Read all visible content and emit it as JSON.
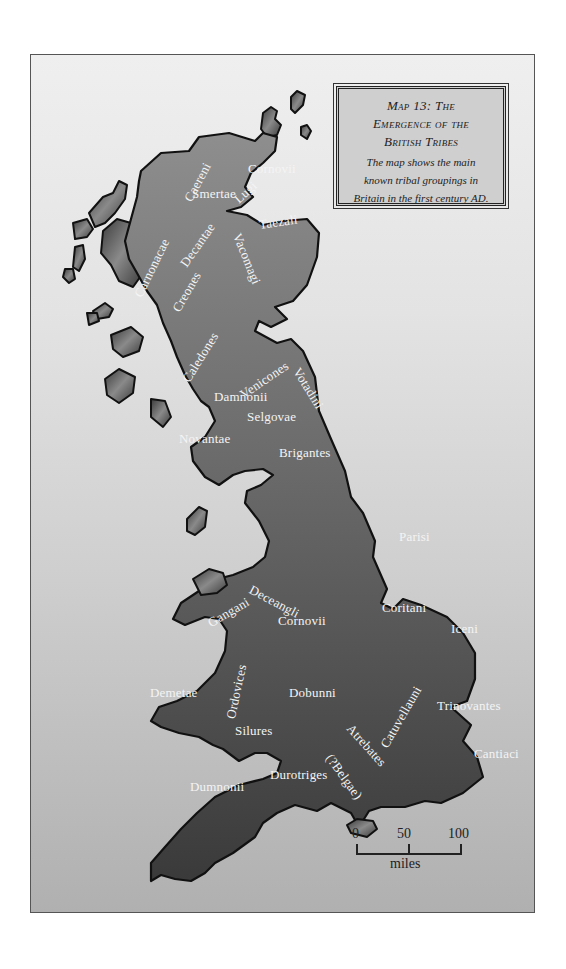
{
  "legend": {
    "title_line1": "Map 13: The",
    "title_line2": "Emergence of the",
    "title_line3": "British Tribes",
    "desc_line1": "The map shows the main",
    "desc_line2": "known tribal groupings in",
    "desc_line3": "Britain in the first century AD."
  },
  "tribes": [
    {
      "name": "Cornovii",
      "region": "north-scotland"
    },
    {
      "name": "Caereni",
      "region": "north-scotland"
    },
    {
      "name": "Smertae",
      "region": "north-scotland"
    },
    {
      "name": "Lugi",
      "region": "north-scotland"
    },
    {
      "name": "Carnonacae",
      "region": "north-scotland"
    },
    {
      "name": "Decantae",
      "region": "north-scotland"
    },
    {
      "name": "Taezali",
      "region": "scotland"
    },
    {
      "name": "Creones",
      "region": "scotland"
    },
    {
      "name": "Vacomagi",
      "region": "scotland"
    },
    {
      "name": "Caledones",
      "region": "scotland"
    },
    {
      "name": "Venicones",
      "region": "scotland"
    },
    {
      "name": "Damnonii",
      "region": "scotland"
    },
    {
      "name": "Votadini",
      "region": "scotland"
    },
    {
      "name": "Selgovae",
      "region": "scotland"
    },
    {
      "name": "Novantae",
      "region": "scotland"
    },
    {
      "name": "Brigantes",
      "region": "england"
    },
    {
      "name": "Parisi",
      "region": "england"
    },
    {
      "name": "Gangani",
      "region": "wales"
    },
    {
      "name": "Deceangli",
      "region": "wales"
    },
    {
      "name": "Coritani",
      "region": "england"
    },
    {
      "name": "Iceni",
      "region": "england"
    },
    {
      "name": "Ordovices",
      "region": "wales"
    },
    {
      "name": "Cornovii",
      "region": "england"
    },
    {
      "name": "Demetae",
      "region": "wales"
    },
    {
      "name": "Dobunni",
      "region": "england"
    },
    {
      "name": "Catuvellauni",
      "region": "england"
    },
    {
      "name": "Trinovantes",
      "region": "england"
    },
    {
      "name": "Silures",
      "region": "wales"
    },
    {
      "name": "Atrebates",
      "region": "england"
    },
    {
      "name": "(?Belgae)",
      "region": "england"
    },
    {
      "name": "Cantiaci",
      "region": "england"
    },
    {
      "name": "Durotriges",
      "region": "england"
    },
    {
      "name": "Dumnonii",
      "region": "england"
    }
  ],
  "scale_bar": {
    "ticks": [
      "0",
      "50",
      "100"
    ],
    "unit": "miles"
  },
  "colors": {
    "land_top": "#8a8a8a",
    "land_bottom": "#3a3a3a",
    "coastline": "#111111",
    "sea_top": "#efefef",
    "sea_bottom": "#b0b0b0",
    "label": "#f4f4f4",
    "legend_bg": "#cfcfcf"
  }
}
